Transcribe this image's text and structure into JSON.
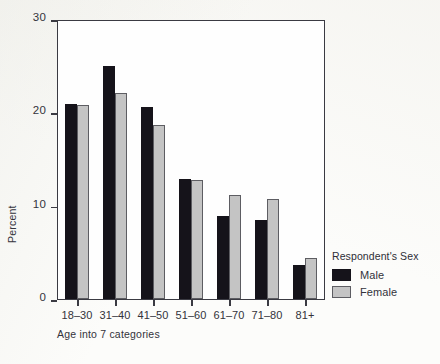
{
  "chart_data": {
    "type": "bar",
    "title": "",
    "subtitle": "",
    "xlabel": "Age into 7 categories",
    "ylabel": "Percent",
    "ylim": [
      0,
      30
    ],
    "yticks": [
      0,
      10,
      20,
      30
    ],
    "grid": false,
    "legend_position": "right",
    "legend_title": "Respondent's Sex",
    "categories": [
      "18–30",
      "31–40",
      "41–50",
      "51–60",
      "61–70",
      "71–80",
      "81+"
    ],
    "series": [
      {
        "name": "Male",
        "color": "#15131a",
        "values": [
          21.0,
          25.1,
          20.7,
          13.0,
          9.0,
          8.5,
          3.7
        ]
      },
      {
        "name": "Female",
        "color": "#c4c4c4",
        "values": [
          20.9,
          22.2,
          18.8,
          12.8,
          11.2,
          10.8,
          4.4
        ]
      }
    ]
  },
  "axes": {
    "y": {
      "label": "Percent",
      "tick_labels": [
        "0",
        "10",
        "20",
        "30"
      ],
      "min": 0,
      "max": 30
    },
    "x": {
      "label": "Age into 7 categories",
      "tick_labels": [
        "18–30",
        "31–40",
        "41–50",
        "51–60",
        "61–70",
        "71–80",
        "81+"
      ]
    }
  },
  "legend": {
    "title": "Respondent's Sex",
    "items": [
      {
        "label": "Male",
        "swatch": "male-swatch"
      },
      {
        "label": "Female",
        "swatch": "female-swatch"
      }
    ]
  },
  "colors": {
    "male": "#15131a",
    "female": "#c4c4c4",
    "axis": "#3a3a42",
    "text": "#33333b",
    "background": "#fcfcfa"
  }
}
